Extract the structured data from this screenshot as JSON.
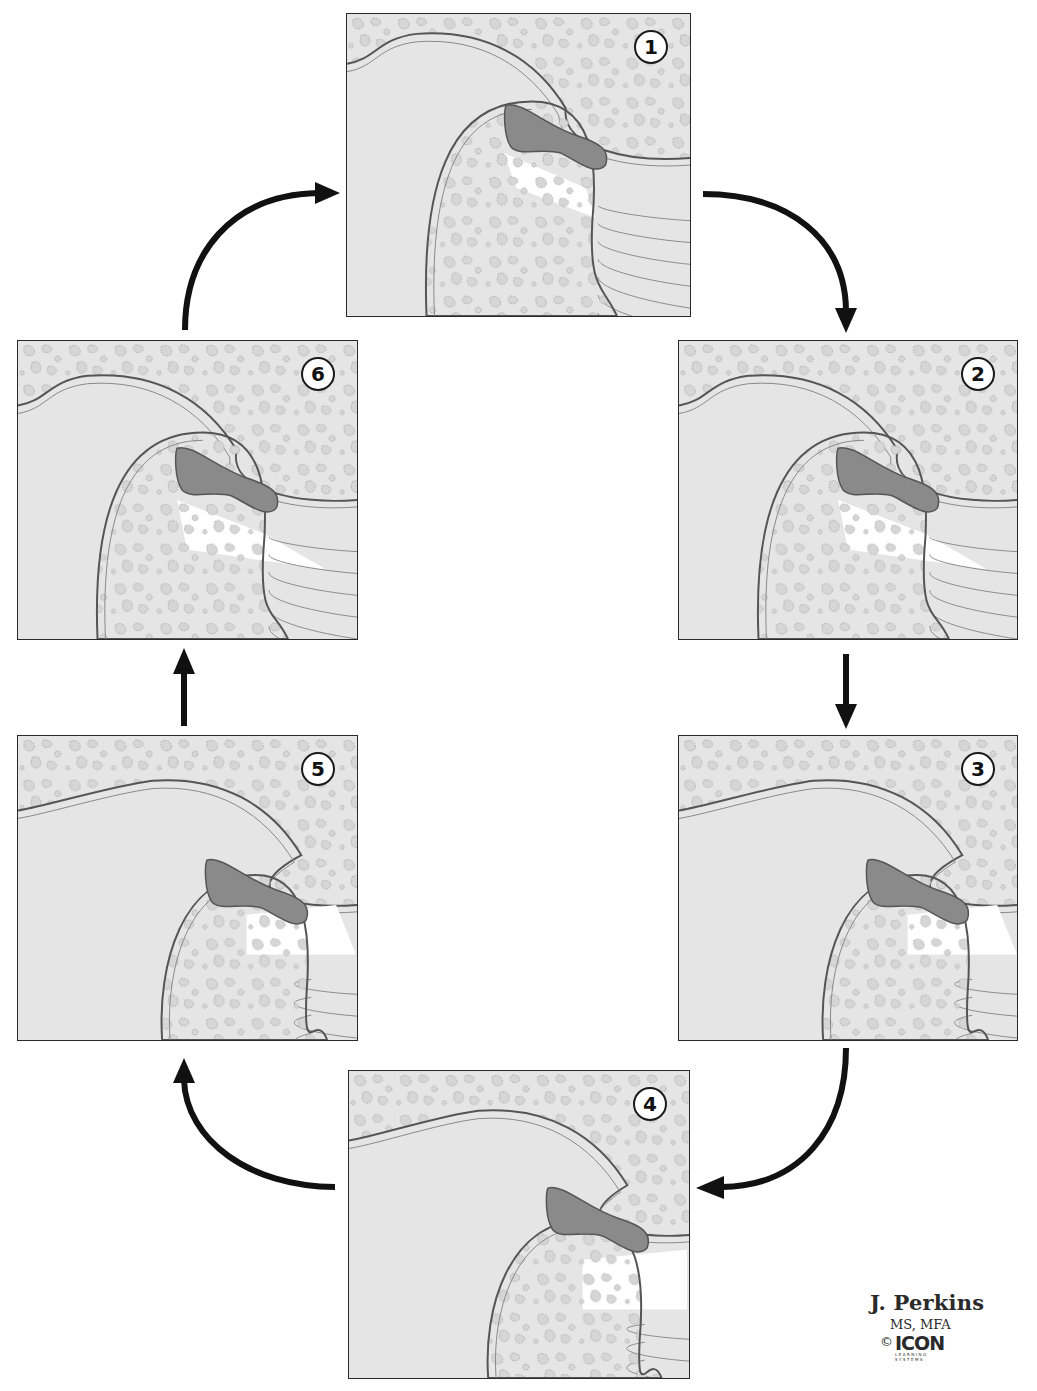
{
  "figure": {
    "colors": {
      "bone": "#e4e4e4",
      "trabecula_outline": "#9a9a9a",
      "cortex_line": "#555555",
      "cartilage": "#cfcfcf",
      "disc": "#8a8a8a",
      "disc_outline": "#555555",
      "muscle": "#d2d2d2",
      "muscle_lines": "#8c8c8c",
      "joint_space": "#ffffff",
      "arrow": "#111111"
    },
    "panels": [
      {
        "id": "1",
        "label": "1",
        "stage": "closed",
        "x": 346,
        "y": 13,
        "w": 345,
        "h": 304
      },
      {
        "id": "2",
        "label": "2",
        "stage": "early rotation",
        "x": 678,
        "y": 340,
        "w": 340,
        "h": 300
      },
      {
        "id": "3",
        "label": "3",
        "stage": "translation begins",
        "x": 678,
        "y": 735,
        "w": 340,
        "h": 306
      },
      {
        "id": "4",
        "label": "4",
        "stage": "maximal opening",
        "x": 348,
        "y": 1070,
        "w": 342,
        "h": 309
      },
      {
        "id": "5",
        "label": "5",
        "stage": "closing translation",
        "x": 17,
        "y": 735,
        "w": 341,
        "h": 306
      },
      {
        "id": "6",
        "label": "6",
        "stage": "closing rotation",
        "x": 17,
        "y": 340,
        "w": 341,
        "h": 300
      }
    ],
    "arrows": [
      {
        "from": "1",
        "to": "2",
        "shape": "curved"
      },
      {
        "from": "2",
        "to": "3",
        "shape": "straight-down"
      },
      {
        "from": "3",
        "to": "4",
        "shape": "curved"
      },
      {
        "from": "4",
        "to": "5",
        "shape": "curved"
      },
      {
        "from": "5",
        "to": "6",
        "shape": "straight-up"
      },
      {
        "from": "6",
        "to": "1",
        "shape": "curved"
      }
    ]
  },
  "credit": {
    "author": "J. Perkins",
    "degrees": "MS, MFA",
    "copyright_symbol": "©",
    "logo_text": "ICON",
    "logo_subtext_1": "LEARNING",
    "logo_subtext_2": "SYSTEMS"
  }
}
